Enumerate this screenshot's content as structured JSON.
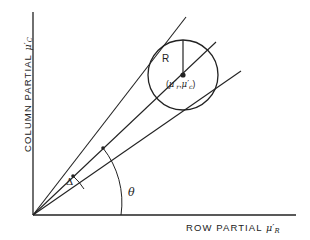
{
  "figure": {
    "background_color": "#ffffff",
    "ink_color": "#222222"
  },
  "axes": {
    "y": {
      "label_text": "COLUMN PARTIAL ",
      "symbol_base": "μ",
      "symbol_prime": "′",
      "symbol_subscript": "C"
    },
    "x": {
      "label_text": "ROW PARTIAL ",
      "symbol_base": "μ",
      "symbol_prime": "′",
      "symbol_subscript": "R"
    }
  },
  "annotations": {
    "radius_label": "R",
    "center_open_paren": "(",
    "center_symbol_1": "μ",
    "center_prime_1": "′",
    "center_sub_1": "r",
    "center_comma": ",",
    "center_symbol_2": "μ",
    "center_prime_2": "′",
    "center_sub_2": "c",
    "center_close_paren": ")",
    "theta_label": "θ",
    "delta_label": "Δ"
  },
  "geometry": {
    "origin_x": 33,
    "origin_y": 215,
    "circle_center_x": 183,
    "circle_center_y": 75,
    "circle_radius": 35,
    "upper_ray_end_x": 186,
    "upper_ray_end_y": 17,
    "middle_ray_end_x": 183,
    "middle_ray_end_y": 75,
    "lower_ray_end_x": 241,
    "lower_ray_end_y": 71,
    "theta_arc_radius": 88,
    "delta_arc_radius": 58,
    "y_axis_top": 12,
    "x_axis_right": 296
  }
}
